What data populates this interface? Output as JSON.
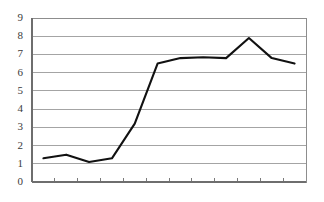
{
  "chart_data": {
    "type": "line",
    "title": "",
    "subtitle": "",
    "xlabel": "",
    "ylabel": "",
    "x": [
      1,
      2,
      3,
      4,
      5,
      6,
      7,
      8,
      9,
      10,
      11,
      12
    ],
    "categories": [
      "1",
      "2",
      "3",
      "4",
      "5",
      "6",
      "7",
      "8",
      "9",
      "10",
      "11",
      "12"
    ],
    "series": [
      {
        "name": "series-1",
        "color": "#111111",
        "values": [
          1.3,
          1.5,
          1.1,
          1.3,
          3.2,
          6.5,
          6.8,
          6.85,
          6.8,
          7.9,
          6.8,
          6.5
        ]
      }
    ],
    "ylim": [
      0,
      9
    ],
    "xlim": [
      0.5,
      12.5
    ],
    "ytick_values": [
      0,
      1,
      2,
      3,
      4,
      5,
      6,
      7,
      8,
      9
    ],
    "ytick_labels": [
      "0",
      "1",
      "2",
      "3",
      "4",
      "5",
      "6",
      "7",
      "8",
      "9"
    ],
    "xtick_labels": [
      "",
      "",
      "",
      "",
      "",
      "",
      "",
      "",
      "",
      "",
      "",
      ""
    ],
    "x_tick_count": 11,
    "grid": true,
    "grid_axis": "y",
    "legend": false,
    "legend_position": "none",
    "annotations": [],
    "colors": {
      "series": "#111111",
      "grid": "#9a9a9a",
      "axis": "#6e6e6e",
      "tick_label": "#3a3a3a",
      "background": "#ffffff"
    }
  },
  "layout": {
    "plot_left": 32,
    "plot_right": 306,
    "plot_top": 18,
    "plot_bottom": 182
  }
}
